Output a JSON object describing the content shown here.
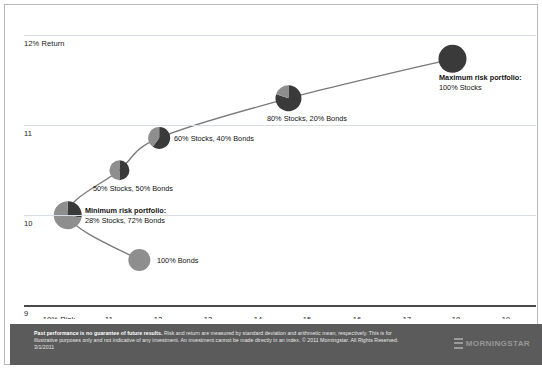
{
  "chart_data": {
    "type": "scatter",
    "title": "",
    "xlabel": "Risk",
    "ylabel": "Return",
    "xlim": [
      9.3,
      19.6
    ],
    "ylim": [
      9.0,
      12.25
    ],
    "grid": true,
    "legend": "none",
    "x_ticks": [
      {
        "value": 10,
        "label": "10% Risk"
      },
      {
        "value": 11,
        "label": "11"
      },
      {
        "value": 12,
        "label": "12"
      },
      {
        "value": 13,
        "label": "13"
      },
      {
        "value": 14,
        "label": "14"
      },
      {
        "value": 15,
        "label": "15"
      },
      {
        "value": 16,
        "label": "16"
      },
      {
        "value": 17,
        "label": "17"
      },
      {
        "value": 18,
        "label": "18"
      },
      {
        "value": 19,
        "label": "19"
      }
    ],
    "y_ticks": [
      {
        "value": 12,
        "label": "12% Return"
      },
      {
        "value": 11,
        "label": "11"
      },
      {
        "value": 10,
        "label": "10"
      },
      {
        "value": 9,
        "label": "9"
      }
    ],
    "points": [
      {
        "id": "bonds-100",
        "label": "100% Bonds",
        "label_bold": "",
        "x": 11.62,
        "y": 9.5,
        "stocks_pct": 0,
        "bonds_pct": 100,
        "radius": 11
      },
      {
        "id": "minimum-risk",
        "label": "28% Stocks, 72% Bonds",
        "label_bold": "Minimum risk portfolio:",
        "x": 10.18,
        "y": 10.0,
        "stocks_pct": 28,
        "bonds_pct": 72,
        "radius": 14
      },
      {
        "id": "stocks-50",
        "label": "50% Stocks, 50% Bonds",
        "label_bold": "",
        "x": 11.22,
        "y": 10.5,
        "stocks_pct": 50,
        "bonds_pct": 50,
        "radius": 10
      },
      {
        "id": "stocks-60",
        "label": "60% Stocks, 40% Bonds",
        "label_bold": "",
        "x": 12.02,
        "y": 10.86,
        "stocks_pct": 60,
        "bonds_pct": 40,
        "radius": 11
      },
      {
        "id": "stocks-80",
        "label": "80% Stocks, 20% Bonds",
        "label_bold": "",
        "x": 14.62,
        "y": 11.3,
        "stocks_pct": 80,
        "bonds_pct": 20,
        "radius": 13
      },
      {
        "id": "maximum-risk",
        "label": "100% Stocks",
        "label_bold": "Maximum risk portfolio:",
        "x": 17.92,
        "y": 11.74,
        "stocks_pct": 100,
        "bonds_pct": 0,
        "radius": 14
      }
    ],
    "colors": {
      "stocks": "#3a3a3a",
      "bonds": "#8e8e8e",
      "curve": "#7a7a7a",
      "gridline": "#d7dde2",
      "axis": "#4a4a4a",
      "footer_bg": "#5b5b5b",
      "border": "#b9b9b9"
    }
  },
  "footer": {
    "disclaimer_bold": "Past performance is no guarantee of future results.",
    "disclaimer_text": " Risk and return are measured by standard deviation and arithmetic mean, respectively. This is for illustrative purposes only and not indicative of any investment. An investment cannot be made directly in an index. © 2011 Morningstar. All Rights Reserved. 3/1/2011",
    "logo_word": "MORNINGSTAR"
  }
}
